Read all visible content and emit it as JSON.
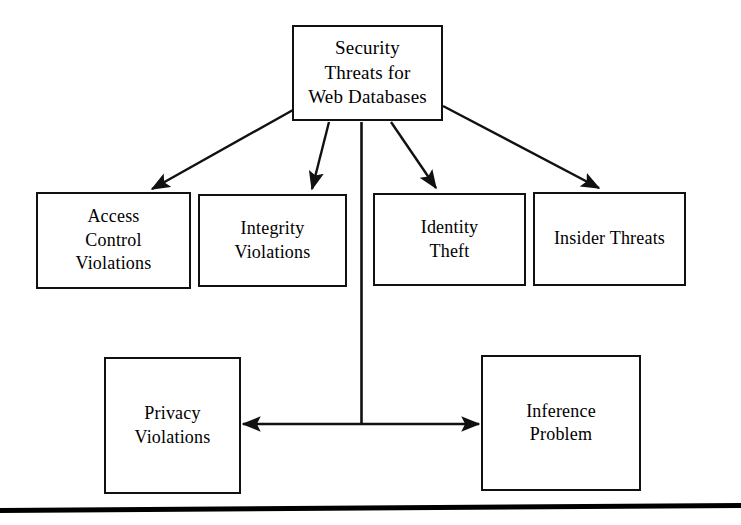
{
  "diagram": {
    "title_node": {
      "id": "security-threats-root",
      "label": "Security\nThreats for\nWeb Databases"
    },
    "threat_nodes": [
      {
        "id": "access-control-violations",
        "label": "Access\nControl\nViolations"
      },
      {
        "id": "integrity-violations",
        "label": "Integrity\nViolations"
      },
      {
        "id": "identity-theft",
        "label": "Identity\nTheft"
      },
      {
        "id": "insider-threats",
        "label": "Insider Threats"
      }
    ],
    "related_nodes": [
      {
        "id": "privacy-violations",
        "label": "Privacy\nViolations"
      },
      {
        "id": "inference-problem",
        "label": "Inference\nProblem"
      }
    ],
    "connectors": [
      {
        "from": "security-threats-root",
        "to": "access-control-violations",
        "arrow": "single"
      },
      {
        "from": "security-threats-root",
        "to": "integrity-violations",
        "arrow": "single"
      },
      {
        "from": "security-threats-root",
        "to": "identity-theft",
        "arrow": "single"
      },
      {
        "from": "security-threats-root",
        "to": "insider-threats",
        "arrow": "single"
      },
      {
        "from": "security-threats-root",
        "to": "privacy-inference-link",
        "arrow": "none"
      },
      {
        "from": "privacy-violations",
        "to": "inference-problem",
        "arrow": "double"
      }
    ],
    "colors": {
      "background": "#ffffff",
      "stroke": "#111111",
      "text": "#000000",
      "rule": "#000000"
    }
  }
}
